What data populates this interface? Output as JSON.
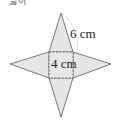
{
  "caption": "넓이",
  "diagram": {
    "type": "square-pyramid-net",
    "fill_color": "#e6e6e6",
    "stroke_color": "#555555",
    "labels": {
      "slant": "6 cm",
      "base": "4 cm"
    }
  }
}
